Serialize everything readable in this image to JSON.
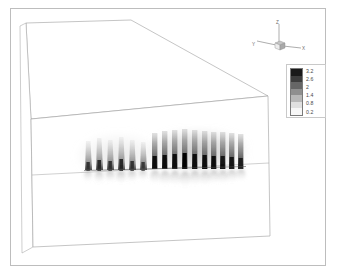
{
  "figure": {
    "type": "3d-flow-visualization"
  },
  "colorbar": {
    "name": "scalar-colorbar",
    "orientation": "vertical",
    "colormap": "grayscale-dark-to-light",
    "labels": [
      "3.2",
      "2.6",
      "2",
      "1.4",
      "0.8",
      "0.2"
    ],
    "values": [
      3.2,
      2.6,
      2.0,
      1.4,
      0.8,
      0.2
    ],
    "step": 0.6,
    "min": 0.2,
    "max": 3.2,
    "swatches": [
      "#1a1a1a",
      "#3d3d3d",
      "#666666",
      "#8f8f8f",
      "#b8b8b8",
      "#e0e0e0",
      "#f7f7f7"
    ]
  },
  "axis_triad": {
    "name": "orientation-axes",
    "x_label": "X",
    "y_label": "Y",
    "z_label": "Z"
  },
  "chart_data": {
    "type": "heatmap",
    "title": "",
    "xlabel": "X",
    "ylabel": "Y",
    "zlabel": "Z",
    "colormap": "grayscale",
    "legend_position": "top-right",
    "grid": false,
    "clim": [
      0.2,
      3.2
    ],
    "tick_labels": [
      "3.2",
      "2.6",
      "2",
      "1.4",
      "0.8",
      "0.2"
    ],
    "plume_count": 16,
    "left_group_count": 6,
    "right_group_count": 10,
    "left_group": {
      "style": "tapered-light",
      "x": [
        88,
        99,
        110,
        121,
        132,
        143
      ],
      "heights": [
        30,
        32,
        31,
        33,
        30,
        29
      ],
      "peak_values": [
        1.4,
        1.6,
        1.5,
        1.7,
        1.4,
        1.3
      ]
    },
    "right_group": {
      "style": "columnar-dark",
      "x": [
        154,
        164,
        174,
        184,
        194,
        204,
        213,
        222,
        231,
        240
      ],
      "heights": [
        37,
        38,
        38,
        39,
        38,
        38,
        37,
        37,
        36,
        35
      ],
      "peak_values": [
        2.6,
        2.8,
        3.0,
        3.2,
        3.0,
        2.9,
        2.8,
        2.7,
        2.6,
        2.4
      ]
    },
    "wall_line_y": 170
  },
  "domain_box": {
    "name": "domain-wireframe",
    "edge_color": "#9a9a9a",
    "faces": [
      "top",
      "front",
      "left-side"
    ],
    "divider_line": "mid-height horizontal split of front face"
  }
}
